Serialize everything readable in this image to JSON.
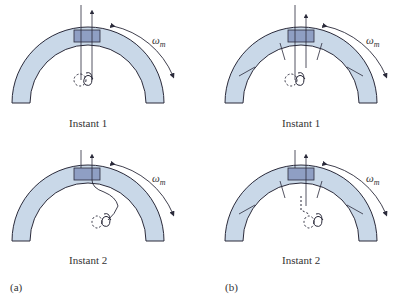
{
  "figure": {
    "panels": [
      {
        "id": "a",
        "label": "(a)",
        "instants": [
          "Instant 1",
          "Instant 2"
        ],
        "segmented": false
      },
      {
        "id": "b",
        "label": "(b)",
        "instants": [
          "Instant 1",
          "Instant 2"
        ],
        "segmented": true
      }
    ],
    "omega_symbol": "ω",
    "omega_subscript": "m",
    "colors": {
      "ring_fill": "#c9d8e8",
      "block_fill": "#8f9fc4",
      "stroke": "#2a2a3a"
    }
  }
}
